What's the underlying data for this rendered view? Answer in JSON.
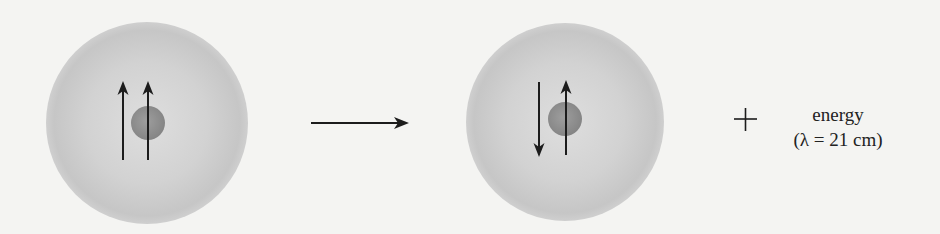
{
  "figure": {
    "initial_state": {
      "name": "hydrogen atom, parallel spins",
      "electron_spin": "up",
      "proton_spin": "up"
    },
    "final_state": {
      "name": "hydrogen atom, antiparallel spins",
      "electron_spin": "down",
      "proton_spin": "up"
    },
    "process_arrow": "→",
    "plus_sign": "+",
    "emission_label": "energy",
    "wavelength_label": "(λ = 21 cm)"
  },
  "colors": {
    "background": "#f4f4f2",
    "electron_cloud": "#c9c9c9",
    "electron_cloud_edge": "#e0e0e0",
    "nucleus": "#8d8d8d",
    "arrow": "#1c1c1c",
    "text": "#222222"
  }
}
